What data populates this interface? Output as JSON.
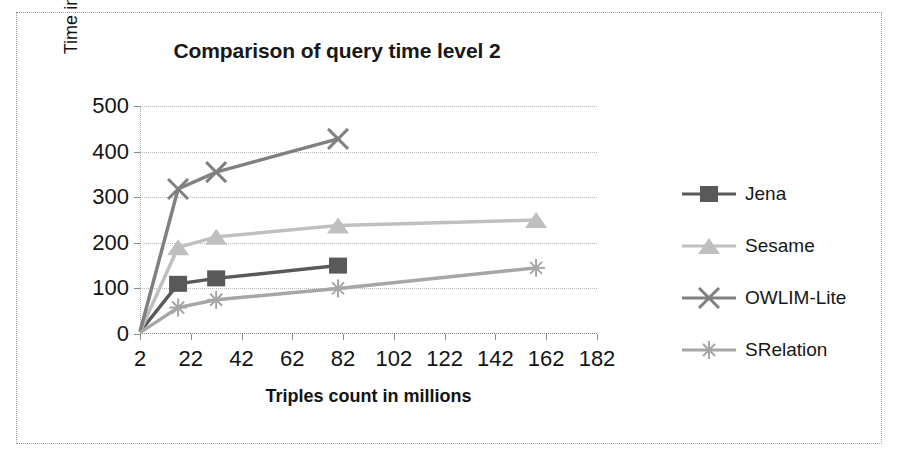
{
  "chart_data": {
    "type": "line",
    "title": "Comparison of query time level 2",
    "xlabel": "Triples count in millions",
    "ylabel": "Time in seconds",
    "xlim": [
      2,
      182
    ],
    "ylim": [
      0,
      500
    ],
    "xticks": [
      "2",
      "22",
      "42",
      "62",
      "82",
      "102",
      "122",
      "142",
      "162",
      "182"
    ],
    "yticks": [
      "0",
      "100",
      "200",
      "300",
      "400",
      "500"
    ],
    "grid": true,
    "legend_position": "right",
    "x": [
      2,
      17,
      32,
      80,
      158
    ],
    "series": [
      {
        "name": "Jena",
        "marker": "square",
        "color": "#595959",
        "values": [
          5,
          110,
          122,
          150,
          null
        ]
      },
      {
        "name": "Sesame",
        "marker": "triangle",
        "color": "#bfbfbf",
        "values": [
          5,
          190,
          213,
          238,
          250
        ]
      },
      {
        "name": "OWLIM-Lite",
        "marker": "x",
        "color": "#808080",
        "values": [
          5,
          318,
          355,
          428,
          null
        ]
      },
      {
        "name": "SRelation",
        "marker": "star",
        "color": "#a6a6a6",
        "values": [
          3,
          58,
          75,
          100,
          145
        ]
      }
    ]
  },
  "legend": {
    "items": [
      {
        "label": "Jena"
      },
      {
        "label": "Sesame"
      },
      {
        "label": "OWLIM-Lite"
      },
      {
        "label": "SRelation"
      }
    ]
  }
}
